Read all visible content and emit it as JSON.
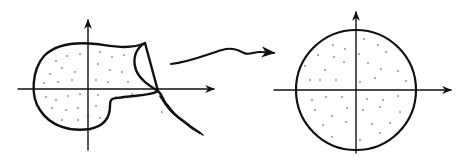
{
  "figure": {
    "colors": {
      "ink": "#111111",
      "dots": "#444444",
      "background": "#ffffff"
    },
    "left_panel": {
      "label": "irregular-region",
      "axes": {
        "origin": [
          88,
          89
        ],
        "x_range": [
          18,
          215
        ],
        "y_range": [
          20,
          150
        ]
      },
      "shape": "blob with cusp and wavy tail"
    },
    "mapping_arrow": {
      "label": "wavy-mapping-arrow",
      "from": [
        170,
        62
      ],
      "to": [
        276,
        52
      ]
    },
    "right_panel": {
      "label": "unit-disk",
      "axes": {
        "origin": [
          356,
          90
        ],
        "x_range": [
          274,
          452
        ],
        "y_range": [
          12,
          153
        ]
      },
      "circle": {
        "cx": 356,
        "cy": 90,
        "r": 60
      }
    }
  }
}
